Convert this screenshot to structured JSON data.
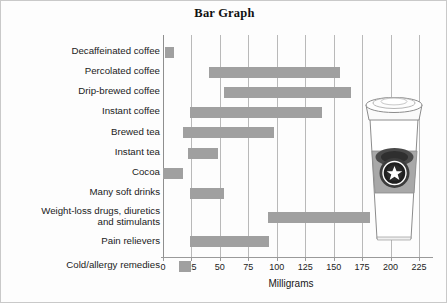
{
  "chart_data": {
    "type": "bar",
    "orientation": "horizontal",
    "title": "Bar Graph",
    "xlabel": "Milligrams",
    "ylabel": "",
    "xlim": [
      0,
      237
    ],
    "xticks": [
      0,
      25,
      50,
      75,
      100,
      125,
      150,
      175,
      200,
      225
    ],
    "xtick_labels": [
      "0",
      "25",
      "50",
      "75",
      "100",
      "125",
      "150",
      "175",
      "200",
      "225"
    ],
    "grid": "vertical",
    "legend": "none",
    "bar_color": "#a0a0a0",
    "note": "Range bars: each bar spans from a low to a high caffeine value",
    "categories": [
      "Decaffeinated coffee",
      "Percolated coffee",
      "Drip-brewed coffee",
      "Instant coffee",
      "Brewed tea",
      "Instant tea",
      "Cocoa",
      "Many soft drinks",
      "Weight-loss drugs, diuretics\nand stimulants",
      "Pain relievers",
      "Cold/allergy remedies"
    ],
    "ranges": [
      [
        2,
        10
      ],
      [
        40,
        156
      ],
      [
        54,
        165
      ],
      [
        24,
        140
      ],
      [
        18,
        98
      ],
      [
        22,
        48
      ],
      [
        0,
        18
      ],
      [
        24,
        54
      ],
      [
        92,
        182
      ],
      [
        24,
        93
      ],
      [
        14,
        25
      ]
    ]
  },
  "illustration": {
    "name": "to-go-coffee-cup",
    "description": "Paper coffee cup with lid, sleeve and star logo"
  }
}
